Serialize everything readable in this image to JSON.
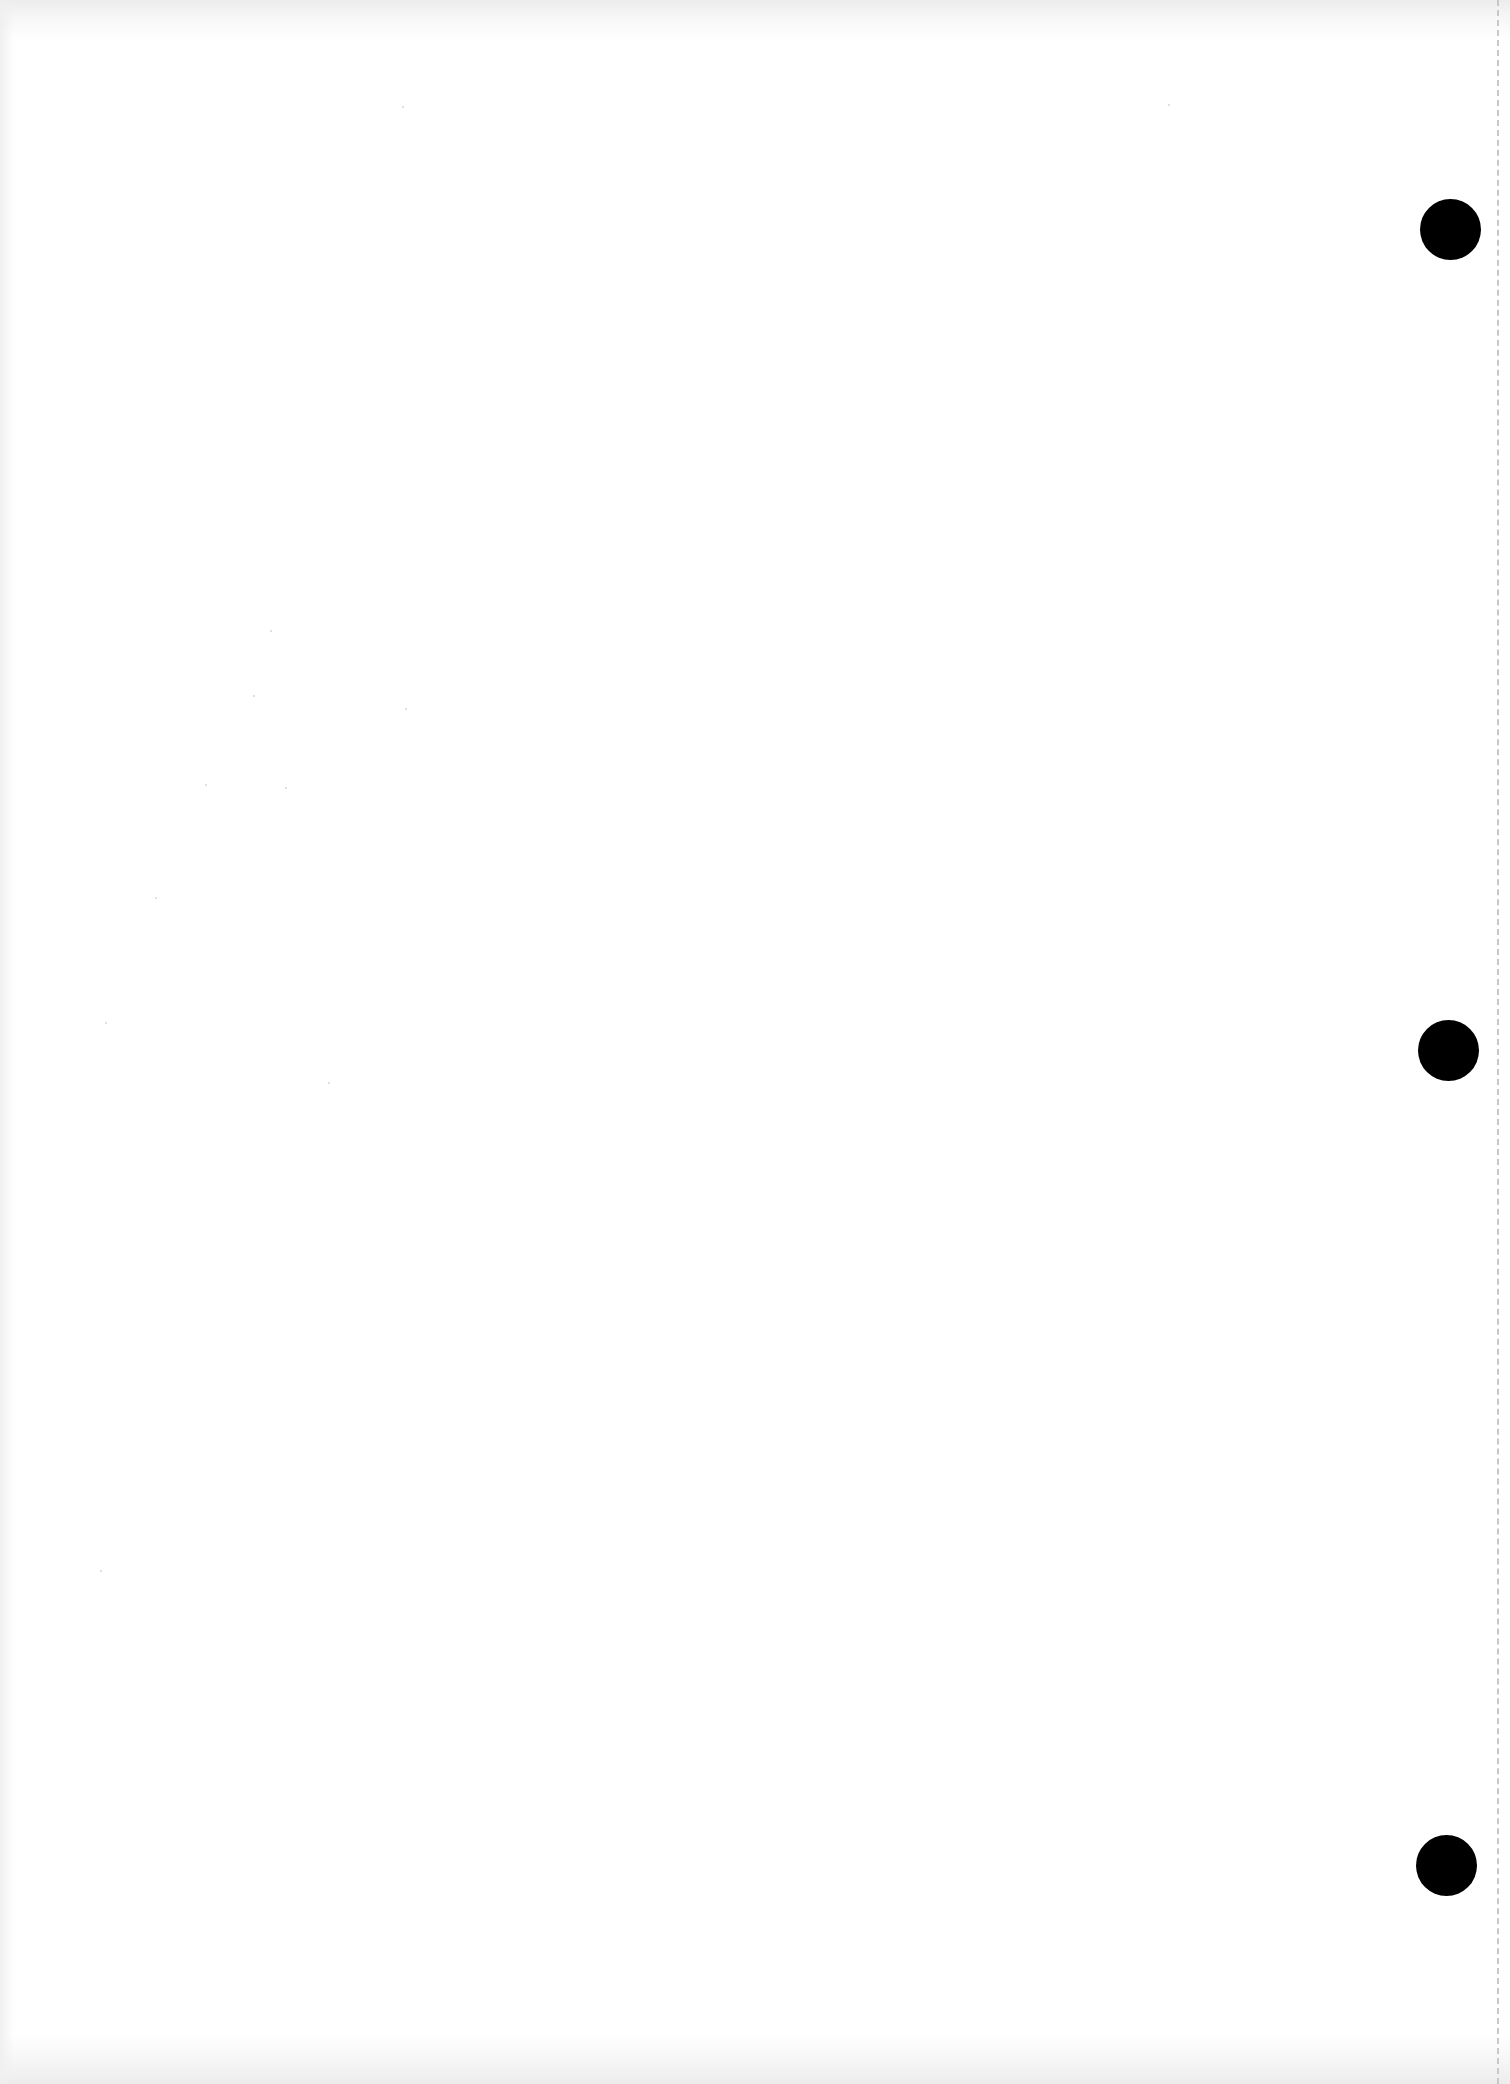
{
  "document": {
    "type": "blank punched sheet",
    "text_content": "",
    "background_color": "#ffffff",
    "punch_holes": [
      {
        "cx": 1451,
        "cy": 230,
        "r": 30,
        "color": "#000000"
      },
      {
        "cx": 1449,
        "cy": 1051,
        "r": 30,
        "color": "#000000"
      },
      {
        "cx": 1447,
        "cy": 1866,
        "r": 30,
        "color": "#000000"
      }
    ],
    "perforation_line": {
      "x": 1498,
      "style": "dashed",
      "color": "#c8c8c8"
    }
  }
}
